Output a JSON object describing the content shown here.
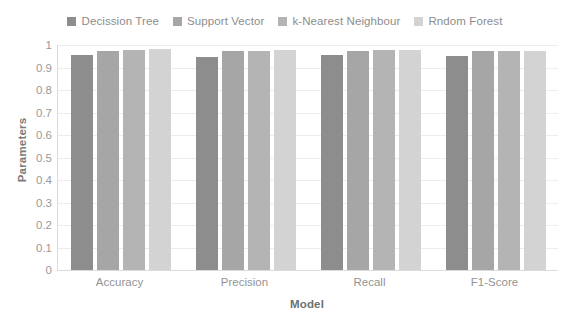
{
  "chart_data": {
    "type": "bar",
    "title": "",
    "xlabel": "Model",
    "ylabel": "Parameters",
    "ylim": [
      0,
      1
    ],
    "ytick_labels": [
      "1",
      "0.9",
      "0.8",
      "0.7",
      "0.6",
      "0.5",
      "0.4",
      "0.3",
      "0.2",
      "0.1",
      "0"
    ],
    "yticks": [
      1,
      0.9,
      0.8,
      0.7,
      0.6,
      0.5,
      0.4,
      0.3,
      0.2,
      0.1,
      0
    ],
    "grid": true,
    "legend_position": "top-center",
    "categories": [
      "Accuracy",
      "Precision",
      "Recall",
      "F1-Score"
    ],
    "series": [
      {
        "name": "Decission Tree",
        "color": "#8d8d8d",
        "values": [
          0.955,
          0.945,
          0.957,
          0.953
        ]
      },
      {
        "name": "Support Vector",
        "color": "#a6a6a6",
        "values": [
          0.973,
          0.974,
          0.972,
          0.975
        ]
      },
      {
        "name": "k-Nearest Neighbour",
        "color": "#b4b4b4",
        "values": [
          0.978,
          0.973,
          0.979,
          0.975
        ]
      },
      {
        "name": "Rndom Forest",
        "color": "#d3d3d3",
        "values": [
          0.981,
          0.977,
          0.977,
          0.974
        ]
      }
    ]
  }
}
